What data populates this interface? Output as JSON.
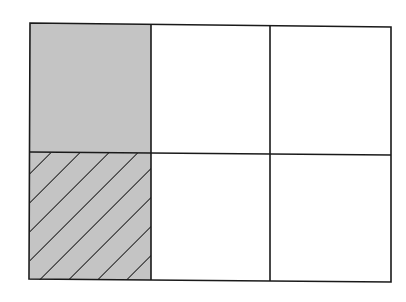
{
  "diagram": {
    "type": "fraction-grid",
    "rows": 2,
    "cols": 3,
    "total_cells": 6,
    "colors": {
      "background": "#ffffff",
      "stroke": "#1a1a1a",
      "shaded_fill": "#c4c4c4",
      "hatch_line": "#111111"
    },
    "cells": [
      {
        "row": 0,
        "col": 0,
        "fill": "shaded",
        "hatched": false
      },
      {
        "row": 0,
        "col": 1,
        "fill": "empty",
        "hatched": false
      },
      {
        "row": 0,
        "col": 2,
        "fill": "empty",
        "hatched": false
      },
      {
        "row": 1,
        "col": 0,
        "fill": "shaded",
        "hatched": true
      },
      {
        "row": 1,
        "col": 1,
        "fill": "empty",
        "hatched": false
      },
      {
        "row": 1,
        "col": 2,
        "fill": "empty",
        "hatched": false
      }
    ],
    "shaded_count": 2,
    "hatched_count": 1
  }
}
